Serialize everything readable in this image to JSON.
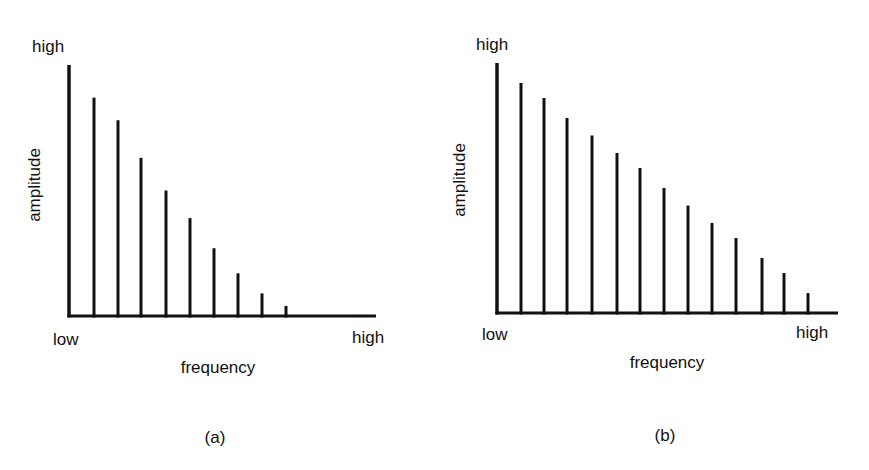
{
  "chart_data": [
    {
      "type": "bar",
      "panel_label": "(a)",
      "title": "",
      "xlabel": "frequency",
      "ylabel": "amplitude",
      "x_tick_labels": {
        "low": "low",
        "high": "high"
      },
      "y_tick_labels": {
        "high": "high"
      },
      "ylim": [
        0,
        100
      ],
      "grid": false,
      "legend": null,
      "note": "line spectrum; amplitudes relative (max = 100), decreasing rapidly with harmonic number",
      "categories": [
        1,
        2,
        3,
        4,
        5,
        6,
        7,
        8,
        9,
        10
      ],
      "values": [
        100,
        87,
        78,
        63,
        50,
        39,
        27,
        17,
        9,
        4
      ],
      "layout": {
        "origin_x": 69,
        "baseline_y": 316,
        "axis_end_x": 376,
        "top_y": 65,
        "bar_x": [
          69,
          94,
          118,
          141,
          166,
          190,
          214,
          238,
          262,
          286
        ],
        "y_label_x": 40,
        "y_label_y": 185,
        "high_y_x": 32,
        "high_y_y": 52,
        "low_x": 53,
        "low_y": 345,
        "high_x_x": 352,
        "high_x_y": 343,
        "xlabel_x": 218,
        "xlabel_y": 373,
        "panel_x": 215,
        "panel_y": 443
      }
    },
    {
      "type": "bar",
      "panel_label": "(b)",
      "title": "",
      "xlabel": "frequency",
      "ylabel": "amplitude",
      "x_tick_labels": {
        "low": "low",
        "high": "high"
      },
      "y_tick_labels": {
        "high": "high"
      },
      "ylim": [
        0,
        100
      ],
      "grid": false,
      "legend": null,
      "note": "line spectrum; amplitudes relative (max = 100), decreasing roughly linearly with harmonic number",
      "categories": [
        1,
        2,
        3,
        4,
        5,
        6,
        7,
        8,
        9,
        10,
        11,
        12,
        13,
        14
      ],
      "values": [
        100,
        92,
        86,
        78,
        71,
        64,
        58,
        50,
        43,
        36,
        30,
        22,
        16,
        8
      ],
      "layout": {
        "origin_x": 497,
        "baseline_y": 313,
        "axis_end_x": 838,
        "top_y": 63,
        "bar_x": [
          497,
          521,
          544,
          567,
          592,
          617,
          640,
          664,
          688,
          712,
          736,
          762,
          784,
          808
        ],
        "y_label_x": 465,
        "y_label_y": 180,
        "high_y_x": 476,
        "high_y_y": 50,
        "low_x": 482,
        "low_y": 340,
        "high_x_x": 796,
        "high_x_y": 338,
        "xlabel_x": 667,
        "xlabel_y": 368,
        "panel_x": 665,
        "panel_y": 441
      }
    }
  ],
  "colors": {
    "ink": "#111111",
    "background": "#ffffff"
  }
}
